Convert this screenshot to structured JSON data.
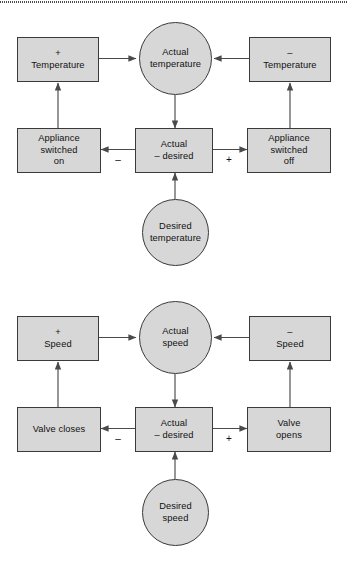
{
  "figure": {
    "top_rule": "dotted-horizontal-rule",
    "style": {
      "node_fill": "#d7d7d7",
      "node_stroke": "#3a3a3a",
      "edge_stroke": "#4a4a4a",
      "text_color": "#111111",
      "background": "#ffffff"
    }
  },
  "diagrams": [
    {
      "id": "temperature-control-loop",
      "nodes": {
        "plus_effect": {
          "label": "+\nTemperature",
          "shape": "rect"
        },
        "minus_effect": {
          "label": "–\nTemperature",
          "shape": "rect"
        },
        "actual": {
          "label": "Actual\ntemperature",
          "shape": "circle"
        },
        "error": {
          "label": "Actual\n– desired",
          "shape": "rect"
        },
        "desired": {
          "label": "Desired\ntemperature",
          "shape": "circle"
        },
        "action_left": {
          "label": "Appliance\nswitched\non",
          "shape": "rect"
        },
        "action_right": {
          "label": "Appliance\nswitched\noff",
          "shape": "rect"
        }
      },
      "edge_labels": {
        "left": "–",
        "right": "+"
      }
    },
    {
      "id": "speed-control-loop",
      "nodes": {
        "plus_effect": {
          "label": "+\nSpeed",
          "shape": "rect"
        },
        "minus_effect": {
          "label": "–\nSpeed",
          "shape": "rect"
        },
        "actual": {
          "label": "Actual\nspeed",
          "shape": "circle"
        },
        "error": {
          "label": "Actual\n– desired",
          "shape": "rect"
        },
        "desired": {
          "label": "Desired\nspeed",
          "shape": "circle"
        },
        "action_left": {
          "label": "Valve closes",
          "shape": "rect"
        },
        "action_right": {
          "label": "Valve\nopens",
          "shape": "rect"
        }
      },
      "edge_labels": {
        "left": "–",
        "right": "+"
      }
    }
  ]
}
